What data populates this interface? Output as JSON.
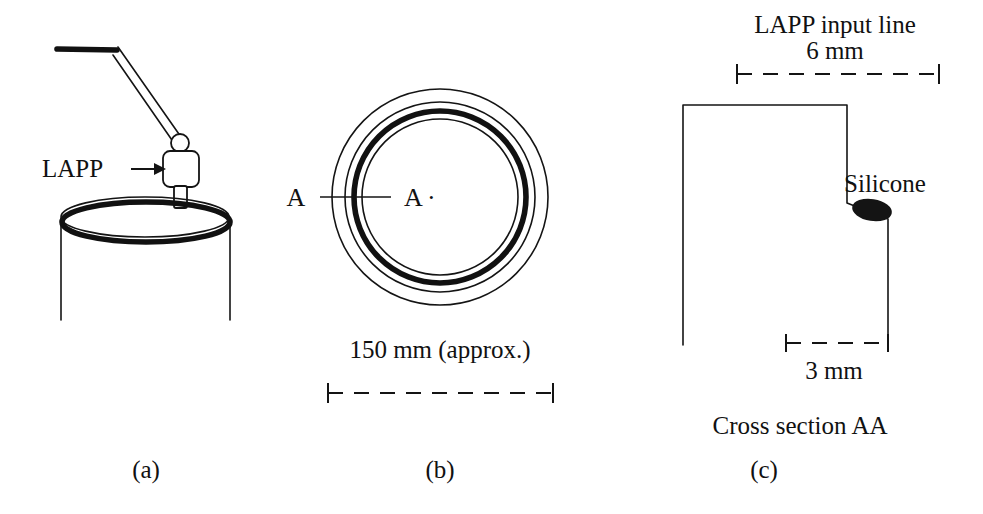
{
  "figure": {
    "kind": "technical-line-diagram",
    "background_color": "#ffffff",
    "ink_color": "#141414"
  },
  "panel_a": {
    "panel_label": "(a)",
    "probe_label": "LAPP",
    "probe_arrow": "→",
    "parts": [
      "cable",
      "arm",
      "joint-circle",
      "probe-body",
      "probe-tip",
      "open-cylinder-vessel"
    ]
  },
  "panel_b": {
    "panel_label": "(b)",
    "section_letter_left": "A",
    "section_letter_right": "A",
    "section_dot": "·",
    "dimension_label": "150 mm (approx.)",
    "ring_count": 4,
    "ring_description": "four concentric circles, third from outside drawn heavy"
  },
  "panel_c": {
    "panel_label": "(c)",
    "top_label_line1": "LAPP input line",
    "top_label_line2": "6 mm",
    "silicone_label": "Silicone",
    "bottom_dimension_label": "3 mm",
    "caption": "Cross section AA"
  }
}
